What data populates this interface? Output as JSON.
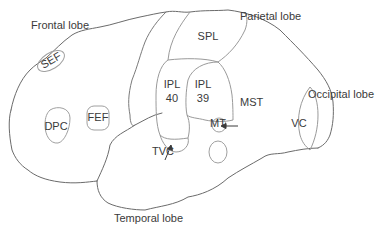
{
  "diagram": {
    "type": "brain-lateral-view",
    "colors": {
      "outline": "#6b6b6b",
      "region": "#9a9a9a",
      "text": "#3a3a3a",
      "background": "#ffffff"
    },
    "lobes": {
      "frontal": "Frontal lobe",
      "parietal": "Parietal lobe",
      "occipital": "Occipital lobe",
      "temporal": "Temporal lobe"
    },
    "regions": {
      "sef": "SEF",
      "fef": "FEF",
      "dpc": "DPC",
      "spl": "SPL",
      "ipl40_line1": "IPL",
      "ipl40_line2": "40",
      "ipl39_line1": "IPL",
      "ipl39_line2": "39",
      "mst": "MST",
      "mt": "MT",
      "vc": "VC",
      "tvc": "TVC"
    }
  }
}
